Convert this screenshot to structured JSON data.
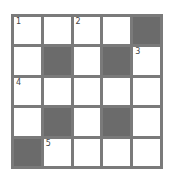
{
  "puzzle": {
    "rows": 5,
    "cols": 5,
    "cells": [
      [
        {
          "black": false,
          "number": "1"
        },
        {
          "black": false,
          "number": ""
        },
        {
          "black": false,
          "number": "2"
        },
        {
          "black": false,
          "number": ""
        },
        {
          "black": true,
          "number": ""
        }
      ],
      [
        {
          "black": false,
          "number": ""
        },
        {
          "black": true,
          "number": ""
        },
        {
          "black": false,
          "number": ""
        },
        {
          "black": true,
          "number": ""
        },
        {
          "black": false,
          "number": "3"
        }
      ],
      [
        {
          "black": false,
          "number": "4"
        },
        {
          "black": false,
          "number": ""
        },
        {
          "black": false,
          "number": ""
        },
        {
          "black": false,
          "number": ""
        },
        {
          "black": false,
          "number": ""
        }
      ],
      [
        {
          "black": false,
          "number": ""
        },
        {
          "black": true,
          "number": ""
        },
        {
          "black": false,
          "number": ""
        },
        {
          "black": true,
          "number": ""
        },
        {
          "black": false,
          "number": ""
        }
      ],
      [
        {
          "black": true,
          "number": ""
        },
        {
          "black": false,
          "number": "5"
        },
        {
          "black": false,
          "number": ""
        },
        {
          "black": false,
          "number": ""
        },
        {
          "black": false,
          "number": ""
        }
      ]
    ]
  },
  "colors": {
    "grid_line": "#7a7a7a",
    "black_cell": "#6b6b6b",
    "white_cell": "#ffffff"
  }
}
